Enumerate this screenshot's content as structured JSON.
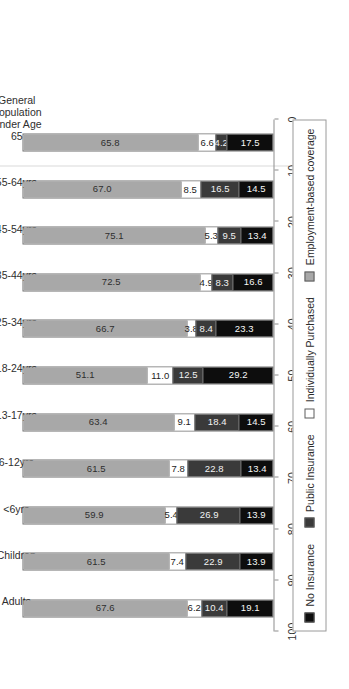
{
  "chart_data": {
    "type": "bar",
    "subtype": "stacked-horizontal",
    "title": "",
    "xlabel": "",
    "ylabel": "Rate of Coverage (Percent)",
    "ylim": [
      0,
      100
    ],
    "ytick_labels": [
      "100",
      "90",
      "80",
      "70",
      "60",
      "50",
      "40",
      "30",
      "20",
      "10",
      "0"
    ],
    "ytick_values": [
      100,
      90,
      80,
      70,
      60,
      50,
      40,
      30,
      20,
      10,
      0
    ],
    "grid": false,
    "legend_position": "bottom",
    "orientation_note": "figure rotated 90 degrees counter-clockwise on the page",
    "categories": [
      "Adults",
      "Children",
      "<6yrs",
      "6-12yrs",
      "13-17yrs",
      "18-24yrs",
      "25-34yrs",
      "35-44yrs",
      "45-54yrs",
      "55-64yrs",
      "General\nPopulation\nUnder Age\n65"
    ],
    "series": [
      {
        "name": "Employment-based coverage",
        "color": "#a8a8a8",
        "values": [
          67.6,
          61.5,
          59.9,
          61.5,
          63.4,
          51.1,
          66.7,
          72.5,
          75.1,
          67.0,
          65.8
        ]
      },
      {
        "name": "Individually Purchased",
        "color": "#ffffff",
        "values": [
          6.2,
          7.4,
          5.4,
          7.8,
          9.1,
          11.0,
          3.8,
          4.9,
          5.3,
          8.5,
          6.6
        ]
      },
      {
        "name": "Public Insurance",
        "color": "#3a3a3a",
        "values": [
          10.4,
          22.9,
          26.9,
          22.8,
          18.4,
          12.5,
          8.4,
          8.3,
          9.5,
          16.5,
          4.2
        ]
      },
      {
        "name": "No Insurance",
        "color": "#0d0d0d",
        "values": [
          19.1,
          13.9,
          13.9,
          13.4,
          14.5,
          29.2,
          23.3,
          16.6,
          13.4,
          14.5,
          17.5
        ]
      }
    ],
    "value_labels": [
      [
        "67.6",
        "6.2",
        "10.4",
        "19.1"
      ],
      [
        "61.5",
        "7.4",
        "22.9",
        "13.9"
      ],
      [
        "59.9",
        "5.4",
        "26.9",
        "13.9"
      ],
      [
        "61.5",
        "7.8",
        "22.8",
        "13.4"
      ],
      [
        "63.4",
        "9.1",
        "18.4",
        "14.5"
      ],
      [
        "51.1",
        "11.0",
        "12.5",
        "29.2"
      ],
      [
        "66.7",
        "3.8",
        "8.4",
        "23.3"
      ],
      [
        "72.5",
        "4.9",
        "8.3",
        "16.6"
      ],
      [
        "75.1",
        "5.3",
        "9.5",
        "13.4"
      ],
      [
        "67.0",
        "8.5",
        "16.5",
        "14.5"
      ],
      [
        "65.8",
        "6.6",
        "4.2",
        "17.5"
      ]
    ]
  },
  "legend": {
    "items": [
      {
        "label": "No Insurance",
        "swatch": "sw-non"
      },
      {
        "label": "Public Insurance",
        "swatch": "sw-pub"
      },
      {
        "label": "Individually Purchased",
        "swatch": "sw-ind"
      },
      {
        "label": "Employment-based coverage",
        "swatch": "sw-emp"
      }
    ]
  }
}
